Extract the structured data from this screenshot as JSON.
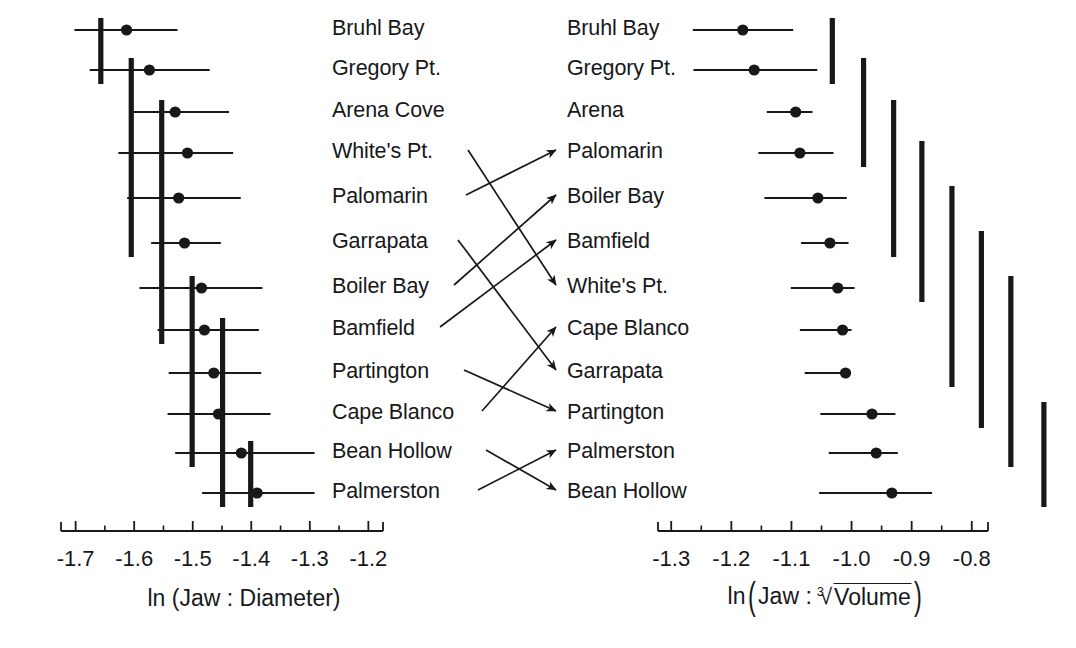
{
  "figure": {
    "type": "paired-dot-interval-plot",
    "panels": [
      {
        "id": "left",
        "axis_label": "ln (Jaw : Diameter)",
        "axis_label_plain": "ln (Jaw : Diameter)",
        "tick_labels": [
          "-1.7",
          "-1.6",
          "-1.5",
          "-1.4",
          "-1.3",
          "-1.2"
        ],
        "tick_values": [
          -1.7,
          -1.6,
          -1.5,
          -1.4,
          -1.3,
          -1.2
        ],
        "minor_ticks_between": 1,
        "axis_range": [
          -1.725,
          -1.175
        ],
        "rows": [
          {
            "label": "Bruhl Bay",
            "mean": -1.613,
            "low": -1.702,
            "high": -1.526
          },
          {
            "label": "Gregory Pt.",
            "mean": -1.574,
            "low": -1.676,
            "high": -1.471
          },
          {
            "label": "Arena Cove",
            "mean": -1.53,
            "low": -1.607,
            "high": -1.438
          },
          {
            "label": "White's Pt.",
            "mean": -1.509,
            "low": -1.627,
            "high": -1.431
          },
          {
            "label": "Palomarin",
            "mean": -1.524,
            "low": -1.612,
            "high": -1.418
          },
          {
            "label": "Garrapata",
            "mean": -1.514,
            "low": -1.571,
            "high": -1.452
          },
          {
            "label": "Boiler Bay",
            "mean": -1.485,
            "low": -1.591,
            "high": -1.381
          },
          {
            "label": "Bamfield",
            "mean": -1.48,
            "low": -1.56,
            "high": -1.387
          },
          {
            "label": "Partington",
            "mean": -1.464,
            "low": -1.541,
            "high": -1.383
          },
          {
            "label": "Cape Blanco",
            "mean": -1.456,
            "low": -1.543,
            "high": -1.367
          },
          {
            "label": "Bean Hollow",
            "mean": -1.417,
            "low": -1.53,
            "high": -1.292
          },
          {
            "label": "Palmerston",
            "mean": -1.39,
            "low": -1.484,
            "high": -1.292
          }
        ],
        "group_bars": [
          {
            "x_value": -1.657,
            "from_row": 1,
            "to_row": 2
          },
          {
            "x_value": -1.605,
            "from_row": 2,
            "to_row": 6
          },
          {
            "x_value": -1.553,
            "from_row": 3,
            "to_row": 8
          },
          {
            "x_value": -1.501,
            "from_row": 7,
            "to_row": 11
          },
          {
            "x_value": -1.449,
            "from_row": 8,
            "to_row": 12
          },
          {
            "x_value": -1.401,
            "from_row": 11,
            "to_row": 12
          }
        ]
      },
      {
        "id": "right",
        "axis_label": "ln (Jaw : cube-root Volume)",
        "axis_label_parts": {
          "prefix": "ln",
          "inner_lead": "Jaw :",
          "radical_index": "3",
          "radicand": "Volume"
        },
        "tick_labels": [
          "-1.3",
          "-1.2",
          "-1.1",
          "-1.0",
          "-0.9",
          "-0.8"
        ],
        "tick_values": [
          -1.3,
          -1.2,
          -1.1,
          -1.0,
          -0.9,
          -0.8
        ],
        "minor_ticks_between": 1,
        "axis_range": [
          -1.322,
          -0.773
        ],
        "rows": [
          {
            "label": "Bruhl Bay",
            "mean": -1.181,
            "low": -1.264,
            "high": -1.097
          },
          {
            "label": "Gregory Pt.",
            "mean": -1.162,
            "low": -1.263,
            "high": -1.057
          },
          {
            "label": "Arena",
            "mean": -1.093,
            "low": -1.141,
            "high": -1.065
          },
          {
            "label": "Palomarin",
            "mean": -1.086,
            "low": -1.155,
            "high": -1.03
          },
          {
            "label": "Boiler Bay",
            "mean": -1.056,
            "low": -1.145,
            "high": -1.008
          },
          {
            "label": "Bamfield",
            "mean": -1.036,
            "low": -1.084,
            "high": -1.005
          },
          {
            "label": "White's Pt.",
            "mean": -1.023,
            "low": -1.101,
            "high": -0.995
          },
          {
            "label": "Cape Blanco",
            "mean": -1.015,
            "low": -1.086,
            "high": -1.0
          },
          {
            "label": "Garrapata",
            "mean": -1.01,
            "low": -1.078,
            "high": -1.008
          },
          {
            "label": "Partington",
            "mean": -0.966,
            "low": -1.052,
            "high": -0.927
          },
          {
            "label": "Palmerston",
            "mean": -0.959,
            "low": -1.038,
            "high": -0.923
          },
          {
            "label": "Bean Hollow",
            "mean": -0.933,
            "low": -1.054,
            "high": -0.866
          }
        ],
        "group_bars": [
          {
            "x_value": -1.032,
            "from_row": 1,
            "to_row": 2
          },
          {
            "x_value": -0.98,
            "from_row": 2,
            "to_row": 4
          },
          {
            "x_value": -0.93,
            "from_row": 3,
            "to_row": 6
          },
          {
            "x_value": -0.883,
            "from_row": 4,
            "to_row": 7
          },
          {
            "x_value": -0.833,
            "from_row": 5,
            "to_row": 9
          },
          {
            "x_value": -0.784,
            "from_row": 6,
            "to_row": 10
          },
          {
            "x_value": -0.735,
            "from_row": 7,
            "to_row": 11
          },
          {
            "x_value": -0.68,
            "from_row": 10,
            "to_row": 12
          }
        ]
      }
    ],
    "connectors": [
      {
        "from_row": 4,
        "to_row": 7
      },
      {
        "from_row": 5,
        "to_row": 4
      },
      {
        "from_row": 6,
        "to_row": 9
      },
      {
        "from_row": 7,
        "to_row": 5
      },
      {
        "from_row": 8,
        "to_row": 6
      },
      {
        "from_row": 9,
        "to_row": 10
      },
      {
        "from_row": 10,
        "to_row": 8
      },
      {
        "from_row": 11,
        "to_row": 12
      },
      {
        "from_row": 12,
        "to_row": 11
      }
    ],
    "colors": {
      "ink": "#17181a",
      "background": "#ffffff"
    }
  },
  "chart_data": {
    "type": "scatter",
    "title": "",
    "subtitle": "",
    "panels": [
      {
        "name": "ln (Jaw : Diameter)",
        "xlabel": "ln (Jaw : Diameter)",
        "ylabel": "",
        "xlim": [
          -1.725,
          -1.175
        ],
        "xticks": [
          -1.7,
          -1.6,
          -1.5,
          -1.4,
          -1.3,
          -1.2
        ],
        "xticklabels": [
          "-1.7",
          "-1.6",
          "-1.5",
          "-1.4",
          "-1.3",
          "-1.2"
        ],
        "grid": false,
        "categories": [
          "Bruhl Bay",
          "Gregory Pt.",
          "Arena Cove",
          "White's Pt.",
          "Palomarin",
          "Garrapata",
          "Boiler Bay",
          "Bamfield",
          "Partington",
          "Cape Blanco",
          "Bean Hollow",
          "Palmerston"
        ],
        "values": [
          -1.613,
          -1.574,
          -1.53,
          -1.509,
          -1.524,
          -1.514,
          -1.485,
          -1.48,
          -1.464,
          -1.456,
          -1.417,
          -1.39
        ],
        "err_low": [
          -1.702,
          -1.676,
          -1.607,
          -1.627,
          -1.612,
          -1.571,
          -1.591,
          -1.56,
          -1.541,
          -1.543,
          -1.53,
          -1.484
        ],
        "err_high": [
          -1.526,
          -1.471,
          -1.438,
          -1.431,
          -1.418,
          -1.452,
          -1.381,
          -1.387,
          -1.383,
          -1.367,
          -1.292,
          -1.292
        ]
      },
      {
        "name": "ln (Jaw : cube-root Volume)",
        "xlabel": "ln (Jaw : 3rd-root Volume)",
        "ylabel": "",
        "xlim": [
          -1.322,
          -0.773
        ],
        "xticks": [
          -1.3,
          -1.2,
          -1.1,
          -1.0,
          -0.9,
          -0.8
        ],
        "xticklabels": [
          "-1.3",
          "-1.2",
          "-1.1",
          "-1.0",
          "-0.9",
          "-0.8"
        ],
        "grid": false,
        "categories": [
          "Bruhl Bay",
          "Gregory Pt.",
          "Arena",
          "Palomarin",
          "Boiler Bay",
          "Bamfield",
          "White's Pt.",
          "Cape Blanco",
          "Garrapata",
          "Partington",
          "Palmerston",
          "Bean Hollow"
        ],
        "values": [
          -1.181,
          -1.162,
          -1.093,
          -1.086,
          -1.056,
          -1.036,
          -1.023,
          -1.015,
          -1.01,
          -0.966,
          -0.959,
          -0.933
        ],
        "err_low": [
          -1.264,
          -1.263,
          -1.141,
          -1.155,
          -1.145,
          -1.084,
          -1.101,
          -1.086,
          -1.078,
          -1.052,
          -1.038,
          -1.054
        ],
        "err_high": [
          -1.097,
          -1.057,
          -1.065,
          -1.03,
          -1.008,
          -1.005,
          -0.995,
          -1.0,
          -1.008,
          -0.927,
          -0.923,
          -0.866
        ]
      }
    ],
    "legend": [],
    "annotations": [
      "Rank-order connectors link the same site between the two panels",
      "Vertical bars mark homogeneous (non-significant) subsets"
    ]
  }
}
